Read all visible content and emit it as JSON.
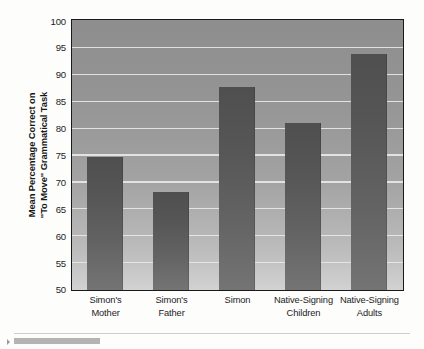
{
  "chart_data": {
    "type": "bar",
    "title": "",
    "subtitle": "",
    "xlabel": "",
    "ylabel_lines": [
      "Mean Percentage Correct on",
      "\"To Move\" Grammatical Task"
    ],
    "ylabel": "Mean Percentage Correct on \"To Move\" Grammatical Task",
    "categories": [
      "Simon's\nMother",
      "Simon's\nFather",
      "Simon",
      "Native-Signing\nChildren",
      "Native-Signing\nAdults"
    ],
    "category_lines": [
      [
        "Simon's",
        "Mother"
      ],
      [
        "Simon's",
        "Father"
      ],
      [
        "Simon",
        ""
      ],
      [
        "Native-Signing",
        "Children"
      ],
      [
        "Native-Signing",
        "Adults"
      ]
    ],
    "values": [
      74.7,
      68.3,
      87.8,
      81.0,
      93.9
    ],
    "ylim": [
      50,
      100
    ],
    "ytick_labels": [
      "50",
      "55",
      "60",
      "65",
      "70",
      "75",
      "80",
      "85",
      "90",
      "95",
      "100"
    ],
    "yticks": [
      50,
      55,
      60,
      65,
      70,
      75,
      80,
      85,
      90,
      95,
      100
    ],
    "grid": true,
    "grid_axis": "y",
    "legend": false,
    "legend_position": "none",
    "bar_color": "#565656",
    "plot_background_color": "#9a9a9a",
    "gridline_color": "#e8e8e6",
    "frame_color": "#1a1a1a"
  }
}
